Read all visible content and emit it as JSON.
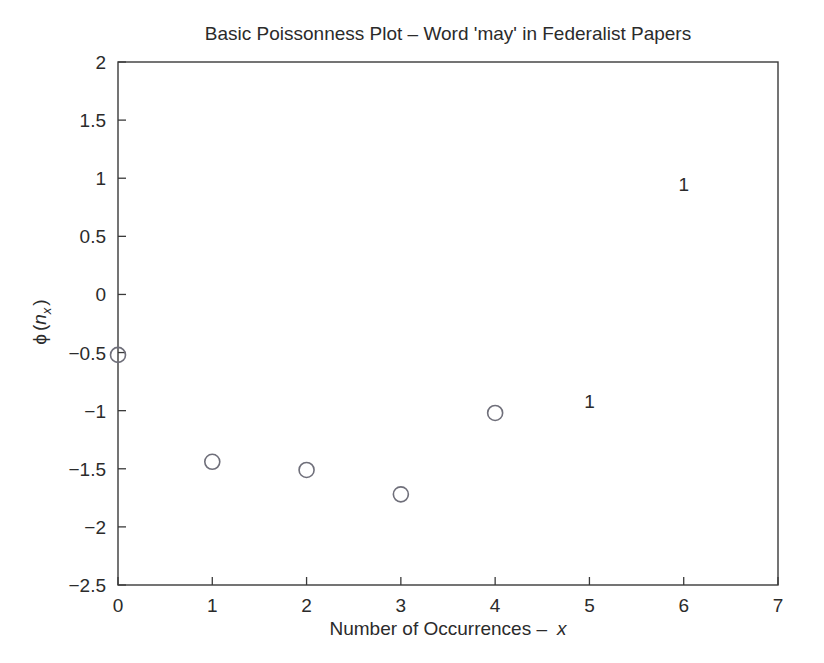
{
  "chart_data": {
    "type": "scatter",
    "title": "Basic Poissonness Plot – Word 'may' in Federalist Papers",
    "xlabel_main": "Number of Occurrences –",
    "xlabel_var": "x",
    "ylabel_phi": "ϕ",
    "ylabel_open": "(",
    "ylabel_n": "n",
    "ylabel_sub": "x",
    "ylabel_close": ")",
    "xlim": [
      0,
      7
    ],
    "ylim": [
      -2.5,
      2
    ],
    "grid": false,
    "legend": null,
    "xticks": [
      "0",
      "1",
      "2",
      "3",
      "4",
      "5",
      "6",
      "7"
    ],
    "xtick_values": [
      0,
      1,
      2,
      3,
      4,
      5,
      6,
      7
    ],
    "yticks": [
      "2",
      "1.5",
      "1",
      "0.5",
      "0",
      "−0.5",
      "−1",
      "−1.5",
      "−2",
      "−2.5"
    ],
    "ytick_values": [
      2,
      1.5,
      1,
      0.5,
      0,
      -0.5,
      -1,
      -1.5,
      -2,
      -2.5
    ],
    "marker_style": "open-circle",
    "marker_color": "#6f6f7a",
    "axis_color": "#3a3a3a",
    "background": "#ffffff",
    "x": [
      0,
      1,
      2,
      3,
      4
    ],
    "y": [
      -0.52,
      -1.44,
      -1.51,
      -1.72,
      -1.02
    ],
    "points": [
      {
        "x": 0,
        "y": -0.52
      },
      {
        "x": 1,
        "y": -1.44
      },
      {
        "x": 2,
        "y": -1.51
      },
      {
        "x": 3,
        "y": -1.72
      },
      {
        "x": 4,
        "y": -1.02
      }
    ],
    "annotations": [
      {
        "label": "1",
        "x": 5,
        "y": -0.92
      },
      {
        "label": "1",
        "x": 6,
        "y": 0.95
      }
    ]
  }
}
